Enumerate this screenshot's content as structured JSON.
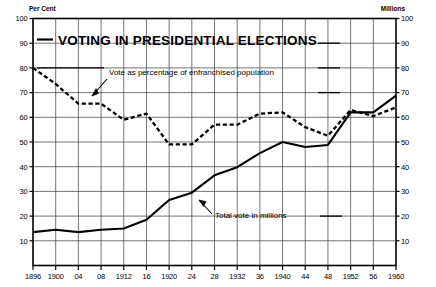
{
  "chart_data": {
    "type": "line",
    "title": "VOTING IN PRESIDENTIAL ELECTIONS",
    "xlabel": "",
    "ylabel": "Per Cent",
    "y2label": "Millions",
    "ylim": [
      0,
      100
    ],
    "y2lim": [
      0,
      100
    ],
    "grid": true,
    "legend_position": "inline-annotations",
    "left_axis_unit": "Per Cent",
    "right_axis_unit": "Millions",
    "y_ticks": [
      100,
      90,
      80,
      70,
      60,
      50,
      40,
      30,
      20,
      10
    ],
    "y_tick_labels": [
      "100",
      "90",
      "80",
      "70",
      "60",
      "50",
      "40",
      "30",
      "20",
      "10"
    ],
    "y2_ticks": [
      100,
      90,
      80,
      70,
      60,
      50,
      40,
      30,
      20,
      10
    ],
    "y2_tick_labels": [
      "100",
      "90",
      "80",
      "70",
      "60",
      "50",
      "40",
      "30",
      "20",
      "10"
    ],
    "x": [
      1896,
      1900,
      1904,
      1908,
      1912,
      1916,
      1920,
      1924,
      1928,
      1932,
      1936,
      1940,
      1944,
      1948,
      1952,
      1956,
      1960
    ],
    "x_tick_labels": [
      "1896",
      "1900",
      "04",
      "08",
      "1912",
      "16",
      "1920",
      "24",
      "28",
      "1932",
      "36",
      "1940",
      "44",
      "48",
      "1952",
      "56",
      "1960"
    ],
    "series": [
      {
        "name": "Vote as percentage of enfranchised population",
        "style": "dashed",
        "axis": "left",
        "unit": "Per Cent",
        "values": [
          80,
          73.5,
          65.5,
          65.5,
          59,
          61.5,
          49,
          49,
          57,
          57,
          61.5,
          62,
          56,
          52.5,
          63,
          60.5,
          64
        ]
      },
      {
        "name": "Total vote in millions",
        "style": "solid",
        "axis": "right",
        "unit": "Millions",
        "values": [
          13.5,
          14.5,
          13.5,
          14.5,
          15,
          18.5,
          26.5,
          29.5,
          36.5,
          39.8,
          45.5,
          50,
          48,
          48.8,
          62,
          62,
          68.8
        ]
      }
    ],
    "annotations": [
      {
        "text": "Vote as percentage of enfranchised population",
        "target_series": "Vote as percentage of enfranchised population"
      },
      {
        "text": "Total vote in millions",
        "target_series": "Total vote in millions"
      }
    ]
  }
}
